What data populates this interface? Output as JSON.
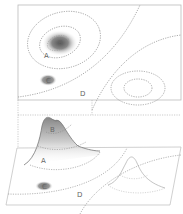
{
  "diagram": {
    "type": "contour-map-with-3d-perspective",
    "top_panel": {
      "view": "plan",
      "labels": [
        {
          "id": "A",
          "text": "A"
        },
        {
          "id": "B",
          "text": "B"
        },
        {
          "id": "C",
          "text": "C"
        },
        {
          "id": "D",
          "text": "D"
        }
      ]
    },
    "bottom_panel": {
      "view": "perspective",
      "labels": [
        {
          "id": "A",
          "text": "A"
        },
        {
          "id": "B",
          "text": "B"
        },
        {
          "id": "C",
          "text": "C"
        },
        {
          "id": "D",
          "text": "D"
        }
      ]
    },
    "colors": {
      "frame": "#bbbbbb",
      "contour": "#888888",
      "peak_shade": "#777777",
      "depression_shade": "#888888",
      "background": "#ffffff"
    }
  }
}
